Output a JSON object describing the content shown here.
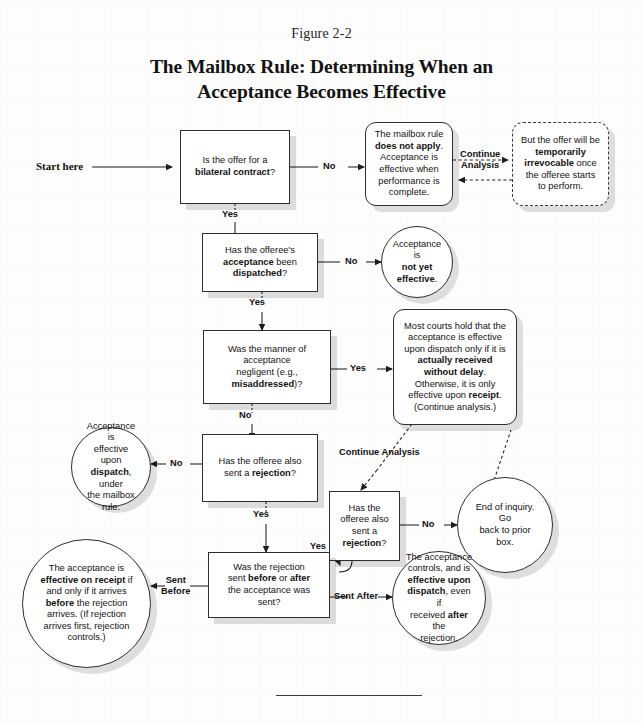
{
  "figure": {
    "label": "Figure 2-2",
    "title_line1": "The Mailbox Rule: Determining When an",
    "title_line2": "Acceptance Becomes Effective"
  },
  "start": {
    "label": "Start here"
  },
  "nodes": {
    "q_bilateral": {
      "text": "Is the offer for a bilateral contract?"
    },
    "mailbox_na": {
      "text": "The mailbox rule does not apply. Acceptance is effective when performance is complete."
    },
    "irrevocable": {
      "text": "But the offer will be temporarily irrevocable once the offeree starts to perform."
    },
    "q_dispatched": {
      "text": "Has the offeree's acceptance been dispatched?"
    },
    "not_yet_effective": {
      "text": "Acceptance is not yet effective."
    },
    "q_negligent": {
      "text": "Was the manner of acceptance negligent (e.g., misaddressed)?"
    },
    "most_courts": {
      "text": "Most courts hold that the acceptance is effective upon dispatch only if it is actually received without delay. Otherwise, it is only effective upon receipt. (Continue analysis.)"
    },
    "effective_dispatch": {
      "text": "Acceptance is effective upon dispatch, under the mailbox rule."
    },
    "q_rejection_main": {
      "text": "Has the offeree also sent a rejection?"
    },
    "q_rejection_side": {
      "text": "Has the offeree also sent a rejection?"
    },
    "end_inquiry": {
      "text": "End of inquiry. Go back to prior box."
    },
    "q_before_after": {
      "text": "Was the rejection sent before or after the acceptance was sent?"
    },
    "receipt_outcome": {
      "text": "The acceptance is effective on receipt if and only if it arrives before the rejection arrives. (If rejection arrives first, rejection controls.)"
    },
    "dispatch_outcome": {
      "text": "The acceptance controls, and is effective upon dispatch, even if received after the rejection."
    }
  },
  "edges": {
    "no_1": "No",
    "continue_analysis_top_1": "Continue",
    "continue_analysis_top_2": "Analysis",
    "yes_1": "Yes",
    "no_2": "No",
    "yes_2": "Yes",
    "no_3": "No",
    "yes_3": "Yes",
    "no_4": "No",
    "continue_analysis_mid": "Continue Analysis",
    "no_5": "No",
    "yes_4": "Yes",
    "sent_before_1": "Sent",
    "sent_before_2": "Before",
    "sent_after": "Sent After"
  }
}
